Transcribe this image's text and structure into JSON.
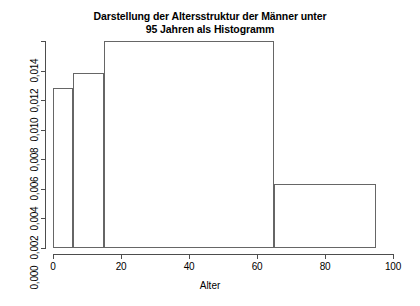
{
  "chart": {
    "title_lines": [
      "Darstellung der Altersstruktur der Männer unter",
      "95 Jahren als Histogramm"
    ],
    "xlabel": "Alter",
    "ylabel": ""
  },
  "chart_data": {
    "type": "bar",
    "subtype": "histogram",
    "title": "Darstellung der Altersstruktur der Männer unter 95 Jahren als Histogramm",
    "xlabel": "Alter",
    "ylabel": "",
    "xlim": [
      0,
      100
    ],
    "ylim": [
      0,
      0.014
    ],
    "grid": false,
    "legend": null,
    "x_ticks": [
      0,
      20,
      40,
      60,
      80,
      100
    ],
    "x_tick_labels": [
      "0",
      "20",
      "40",
      "60",
      "80",
      "100"
    ],
    "y_ticks": [
      0.0,
      0.002,
      0.004,
      0.006,
      0.008,
      0.01,
      0.012,
      0.014
    ],
    "y_tick_labels": [
      "0,000",
      "0,002",
      "0,004",
      "0,006",
      "0,008",
      "0,010",
      "0,012",
      "0,014"
    ],
    "breaks": [
      0,
      6,
      15,
      65,
      95
    ],
    "bins": [
      {
        "x0": 0,
        "x1": 6,
        "density": 0.01082
      },
      {
        "x0": 6,
        "x1": 15,
        "density": 0.01183
      },
      {
        "x0": 15,
        "x1": 65,
        "density": 0.014
      },
      {
        "x0": 65,
        "x1": 95,
        "density": 0.00433
      }
    ],
    "values": [
      0.01082,
      0.01183,
      0.014,
      0.00433
    ],
    "categories": [
      "0–6",
      "6–15",
      "15–65",
      "65–95"
    ],
    "colors": {
      "bar_border": "#666666",
      "bar_fill": "transparent",
      "axis": "#4d4d4d",
      "text": "#000000",
      "background": "#ffffff"
    }
  }
}
